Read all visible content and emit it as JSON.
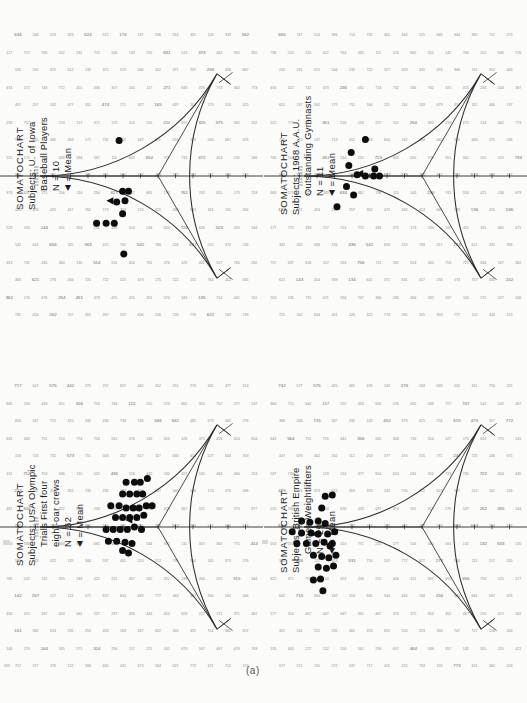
{
  "figure": {
    "panel_letter": "(a)",
    "caption_partial": "",
    "background": "#fbfbfa",
    "ink": "#1a1a1a"
  },
  "panels": [
    {
      "id": "baseball",
      "position": "top-left",
      "title": "SOMATOCHART",
      "subject_lines": [
        "Subjects: U. of Iowa",
        "Baseball  Players"
      ],
      "n_label": "N = 10",
      "mean_label": "= Mean",
      "mean_marker": "◀"
    },
    {
      "id": "gymnasts",
      "position": "top-right",
      "title": "SOMATOCHART",
      "subject_lines": [
        "Subjects: 1968 A.A.U.",
        "Outstanding Gymnasts"
      ],
      "n_label": "N = 11",
      "mean_label": "= Mean",
      "mean_marker": "◀"
    },
    {
      "id": "rowers",
      "position": "bottom-left",
      "title": "SOMATOCHART",
      "subject_lines": [
        "Subjects: USA Olympic",
        "Trials First four",
        "eight-oar crews"
      ],
      "n_label": "N = 32",
      "mean_label": "= Mean",
      "mean_marker": "◀"
    },
    {
      "id": "weightlifters",
      "position": "bottom-right",
      "title": "SOMATOCHART",
      "subject_lines": [
        "Subjects: British Empire",
        "Games Weightlifters"
      ],
      "n_label": "N = 29",
      "mean_label": "= Mean",
      "mean_marker": "◀"
    }
  ],
  "chart_data": {
    "type": "scatter",
    "note": "Sheldon-type somatotype distribution charts; reuleaux-triangle plotting field with endomorphy / mesomorphy / ectomorphy axes. Coordinates below are normalized to the plotting field (x right, y down, origin at field centre, range approx -1..1).",
    "xlabel": "",
    "ylabel": "",
    "grid": true,
    "legend_position": "top-left (rotated)",
    "field": {
      "shape": "reuleaux-triangle",
      "axes": [
        "endomorphy",
        "mesomorphy",
        "ectomorphy"
      ],
      "grid_cell_numbers": "somatotype component triplets printed at each lattice node"
    },
    "series": [
      {
        "name": "U. of Iowa Baseball Players",
        "n": 10,
        "marker": "filled-circle",
        "points": [
          [
            -0.33,
            -0.3
          ],
          [
            -0.3,
            0.13
          ],
          [
            -0.25,
            0.13
          ],
          [
            -0.28,
            0.21
          ],
          [
            -0.35,
            0.22
          ],
          [
            -0.3,
            0.32
          ],
          [
            -0.52,
            0.4
          ],
          [
            -0.44,
            0.4
          ],
          [
            -0.37,
            0.4
          ],
          [
            -0.29,
            0.66
          ]
        ],
        "mean": [
          -0.4,
          0.21
        ]
      },
      {
        "name": "1968 A.A.U. Outstanding Gymnasts",
        "n": 11,
        "marker": "filled-circle",
        "points": [
          [
            -0.48,
            -0.31
          ],
          [
            -0.6,
            -0.2
          ],
          [
            -0.62,
            -0.09
          ],
          [
            -0.55,
            -0.01
          ],
          [
            -0.48,
            0.0
          ],
          [
            -0.41,
            0.0
          ],
          [
            -0.36,
            0.0
          ],
          [
            -0.4,
            -0.06
          ],
          [
            -0.64,
            0.09
          ],
          [
            -0.58,
            0.16
          ],
          [
            -0.72,
            0.26
          ]
        ],
        "mean": [
          -0.52,
          -0.02
        ]
      },
      {
        "name": "USA Olympic Trials First four eight-oar crews",
        "n": 32,
        "marker": "filled-circle",
        "points": [
          [
            -0.27,
            -0.38
          ],
          [
            -0.2,
            -0.38
          ],
          [
            -0.15,
            -0.38
          ],
          [
            -0.09,
            -0.41
          ],
          [
            -0.3,
            -0.28
          ],
          [
            -0.24,
            -0.28
          ],
          [
            -0.18,
            -0.28
          ],
          [
            -0.13,
            -0.28
          ],
          [
            -0.4,
            -0.18
          ],
          [
            -0.33,
            -0.18
          ],
          [
            -0.27,
            -0.16
          ],
          [
            -0.21,
            -0.16
          ],
          [
            -0.16,
            -0.16
          ],
          [
            -0.1,
            -0.18
          ],
          [
            -0.05,
            -0.18
          ],
          [
            -0.36,
            -0.08
          ],
          [
            -0.3,
            -0.08
          ],
          [
            -0.24,
            -0.08
          ],
          [
            -0.18,
            -0.08
          ],
          [
            -0.12,
            -0.1
          ],
          [
            -0.44,
            0.02
          ],
          [
            -0.38,
            0.02
          ],
          [
            -0.32,
            0.02
          ],
          [
            -0.26,
            0.02
          ],
          [
            -0.2,
            0.0
          ],
          [
            -0.14,
            0.02
          ],
          [
            -0.42,
            0.12
          ],
          [
            -0.35,
            0.12
          ],
          [
            -0.28,
            0.13
          ],
          [
            -0.22,
            0.14
          ],
          [
            -0.25,
            0.22
          ],
          [
            -0.3,
            0.2
          ]
        ],
        "mean": [
          -0.24,
          -0.06
        ]
      },
      {
        "name": "British Empire Games Weightlifters",
        "n": 29,
        "marker": "filled-circle",
        "points": [
          [
            -0.82,
            -0.26
          ],
          [
            -0.76,
            -0.27
          ],
          [
            -0.85,
            -0.16
          ],
          [
            -1.02,
            -0.05
          ],
          [
            -0.95,
            -0.04
          ],
          [
            -0.88,
            -0.05
          ],
          [
            -0.82,
            -0.03
          ],
          [
            -1.1,
            0.04
          ],
          [
            -1.02,
            0.05
          ],
          [
            -0.94,
            0.05
          ],
          [
            -0.88,
            0.06
          ],
          [
            -0.8,
            0.06
          ],
          [
            -0.74,
            0.04
          ],
          [
            -1.06,
            0.14
          ],
          [
            -0.98,
            0.14
          ],
          [
            -0.9,
            0.14
          ],
          [
            -0.83,
            0.13
          ],
          [
            -0.76,
            0.14
          ],
          [
            -0.92,
            0.24
          ],
          [
            -0.85,
            0.25
          ],
          [
            -0.79,
            0.26
          ],
          [
            -0.73,
            0.24
          ],
          [
            -0.88,
            0.34
          ],
          [
            -0.81,
            0.35
          ],
          [
            -0.75,
            0.33
          ],
          [
            -0.86,
            0.44
          ],
          [
            -0.92,
            0.45
          ],
          [
            -0.84,
            0.54
          ],
          [
            -0.78,
            0.16
          ]
        ],
        "mean": [
          -0.9,
          0.06
        ]
      }
    ]
  }
}
